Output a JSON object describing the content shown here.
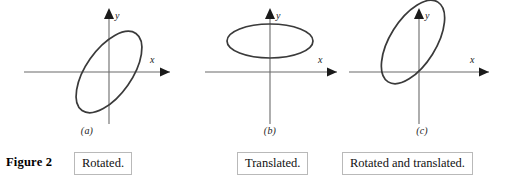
{
  "figure": {
    "number_label": "Figure 2",
    "axis_x_label": "x",
    "axis_y_label": "y",
    "stroke_color": "#3a3a3a",
    "axis_color": "#6b6b6b",
    "border_color": "#b9b9b9",
    "background_color": "#ffffff"
  },
  "panels": [
    {
      "id": "a",
      "sublabel": "(a)",
      "caption": "Rotated.",
      "description": "ellipse rotated about the origin",
      "ellipse": {
        "center_x": 0,
        "center_y": 0,
        "semi_major": 47,
        "semi_minor": 23,
        "rotation_deg": -55
      }
    },
    {
      "id": "b",
      "sublabel": "(b)",
      "caption": "Translated.",
      "description": "horizontal ellipse translated upward",
      "ellipse": {
        "center_x": 0,
        "center_y": 31,
        "semi_major": 43,
        "semi_minor": 17,
        "rotation_deg": 0
      }
    },
    {
      "id": "c",
      "sublabel": "(c)",
      "caption": "Rotated and translated.",
      "description": "ellipse rotated about the origin and translated up and to the left",
      "ellipse": {
        "center_x": -6,
        "center_y": 30,
        "semi_major": 47,
        "semi_minor": 23,
        "rotation_deg": -58
      }
    }
  ]
}
